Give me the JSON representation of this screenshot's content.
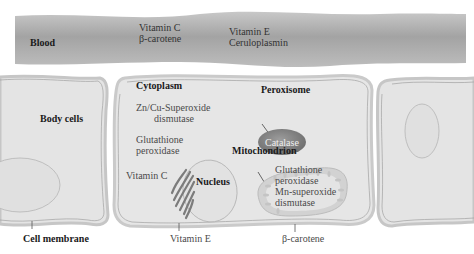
{
  "diagram": {
    "blood": {
      "label": "Blood",
      "antioxidants_group1": [
        "Vitamin C",
        "β-carotene"
      ],
      "antioxidants_group2": [
        "Vitamin E",
        "Ceruloplasmin"
      ]
    },
    "body_cells": {
      "label": "Body cells"
    },
    "cytoplasm": {
      "label": "Cytoplasm",
      "enzyme1_line1": "Zn/Cu-Superoxide",
      "enzyme1_line2": "dismutase",
      "enzyme2_line1": "Glutathione",
      "enzyme2_line2": "peroxidase",
      "vitamin": "Vitamin C"
    },
    "nucleus": {
      "label": "Nucleus"
    },
    "peroxisome": {
      "label": "Peroxisome",
      "content": "Catalase"
    },
    "mitochondrion": {
      "label": "Mitochondrion",
      "lines": [
        "Glutathione",
        "peroxidase",
        "Mn-superoxide",
        "dismutase"
      ]
    },
    "membrane_labels": {
      "cell_membrane": "Cell membrane",
      "vitamin_e": "Vitamin E",
      "beta_carotene": "β-carotene"
    },
    "colors": {
      "blood_vessel": "#a9a9a9",
      "cell_fill": "#e6e6e6",
      "cell_border": "#c8c8c8",
      "peroxisome_fill": "#8a8a8a",
      "mitochondrion_fill": "#d4d4d4"
    }
  }
}
